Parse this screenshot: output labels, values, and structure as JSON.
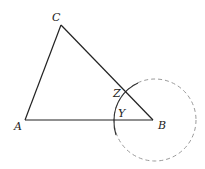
{
  "diagram": {
    "type": "geometric-construction",
    "points": {
      "A": {
        "label": "A",
        "x": 25,
        "y": 120
      },
      "B": {
        "label": "B",
        "x": 153,
        "y": 120
      },
      "C": {
        "label": "C",
        "x": 61,
        "y": 25
      },
      "Z": {
        "label": "Z",
        "x": 125,
        "y": 90
      },
      "Y": {
        "label": "Y",
        "x": 114,
        "y": 120
      }
    },
    "segments": [
      {
        "from": "A",
        "to": "B"
      },
      {
        "from": "A",
        "to": "C"
      },
      {
        "from": "C",
        "to": "B"
      }
    ],
    "circle": {
      "center": "B",
      "cx": 155,
      "cy": 120,
      "r": 41,
      "style": "dashed"
    },
    "colors": {
      "line": "#222222",
      "dashed_circle": "#999999",
      "arc": "#333333"
    }
  }
}
